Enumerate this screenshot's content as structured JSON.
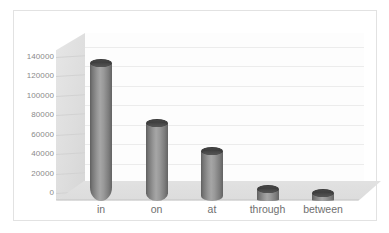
{
  "chart_data": {
    "type": "bar",
    "title": "",
    "subtitle": "",
    "xlabel": "",
    "ylabel": "",
    "categories": [
      "in",
      "on",
      "at",
      "through",
      "between"
    ],
    "values": [
      142000,
      80000,
      51000,
      12000,
      8000
    ],
    "series": [
      {
        "name": "Frequency",
        "values": [
          142000,
          80000,
          51000,
          12000,
          8000
        ]
      }
    ],
    "ylim": [
      0,
      140000
    ],
    "yticks": [
      0,
      20000,
      40000,
      60000,
      80000,
      100000,
      120000,
      140000
    ],
    "ytick_labels": [
      "0",
      "20000",
      "40000",
      "60000",
      "80000",
      "100000",
      "120000",
      "140000"
    ],
    "grid": true,
    "legend": false,
    "legend_position": "none",
    "style": "3d-cylinder",
    "bar_color": "#909090",
    "bar_cap_color": "#444444",
    "gridline_color": "#ececec",
    "wall_color": "#e0e0e0",
    "floor_color": "#e0e0e0",
    "plot_background": "#fdfdfd",
    "axis_text_color": "#8a8a8a",
    "category_text_color": "#6f6f6f",
    "border_color": "#e2e2e2"
  },
  "axis": {
    "y_ticks": [
      {
        "label": "140000",
        "value": 140000
      },
      {
        "label": "120000",
        "value": 120000
      },
      {
        "label": "100000",
        "value": 100000
      },
      {
        "label": "80000",
        "value": 80000
      },
      {
        "label": "60000",
        "value": 60000
      },
      {
        "label": "40000",
        "value": 40000
      },
      {
        "label": "20000",
        "value": 20000
      },
      {
        "label": "0",
        "value": 0
      }
    ]
  },
  "bars": [
    {
      "label": "in",
      "value": 142000
    },
    {
      "label": "on",
      "value": 80000
    },
    {
      "label": "at",
      "value": 51000
    },
    {
      "label": "through",
      "value": 12000
    },
    {
      "label": "between",
      "value": 8000
    }
  ]
}
